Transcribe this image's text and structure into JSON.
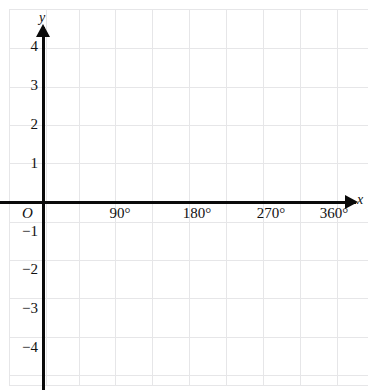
{
  "figure": {
    "type": "coordinate-grid",
    "background_color": "#ffffff",
    "grid_color": "#e6e6e8",
    "axis_color": "#0a0a0a"
  },
  "axes": {
    "x_axis_name": "x",
    "y_axis_name": "y",
    "origin_label": "O"
  },
  "chart_data": {
    "type": "line",
    "title": "",
    "xlabel": "x",
    "ylabel": "y",
    "grid": true,
    "legend": null,
    "series": [],
    "xlim": [
      -30,
      390
    ],
    "ylim": [
      -4.6,
      4.6
    ],
    "x_ticks": [
      90,
      180,
      270,
      360
    ],
    "x_tick_labels": [
      "90°",
      "180°",
      "270°",
      "360°"
    ],
    "y_ticks": [
      4,
      3,
      2,
      1,
      -1,
      -2,
      -3,
      -4
    ],
    "y_tick_labels": [
      "4",
      "3",
      "2",
      "1",
      "−1",
      "−2",
      "−3",
      "−4"
    ],
    "x_minor_step": 45,
    "y_minor_step": 1,
    "annotations": []
  },
  "x_tick_items": [
    {
      "label": "90°",
      "left": 90
    },
    {
      "label": "180°",
      "left": 167
    },
    {
      "label": "270°",
      "left": 241
    },
    {
      "label": "360°",
      "left": 304
    }
  ],
  "y_tick_items": [
    {
      "label": "4",
      "top": 39
    },
    {
      "label": "3",
      "top": 78
    },
    {
      "label": "2",
      "top": 117
    },
    {
      "label": "1",
      "top": 156
    },
    {
      "label": "−1",
      "top": 224
    },
    {
      "label": "−2",
      "top": 262
    },
    {
      "label": "−3",
      "top": 301
    },
    {
      "label": "−4",
      "top": 340
    }
  ],
  "gridlines": {
    "vertical_x": [
      9,
      46,
      79,
      115,
      152,
      189,
      226,
      263,
      300,
      337
    ],
    "horizontal_y": [
      9,
      48,
      87,
      125,
      163,
      222,
      260,
      298,
      337,
      375,
      385
    ]
  }
}
